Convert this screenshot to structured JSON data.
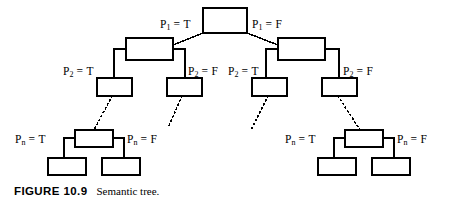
{
  "figure": {
    "number_label": "FIGURE 10.9",
    "caption": "Semantic tree."
  },
  "diagram": {
    "type": "binary-semantic-tree",
    "stroke_color": "#000000",
    "node_fill": "#ffffff",
    "edge_styles": [
      "solid",
      "dotted"
    ],
    "labels": {
      "p1_true": {
        "var": "P",
        "sub": "1",
        "eq": " = ",
        "val": "T"
      },
      "p1_false": {
        "var": "P",
        "sub": "1",
        "eq": " = ",
        "val": "F"
      },
      "p2_true_left": {
        "var": "P",
        "sub": "2",
        "eq": " = ",
        "val": "T"
      },
      "p2_false_left": {
        "var": "P",
        "sub": "2",
        "eq": " = ",
        "val": "F"
      },
      "p2_true_right": {
        "var": "P",
        "sub": "2",
        "eq": " = ",
        "val": "T"
      },
      "p2_false_right": {
        "var": "P",
        "sub": "2",
        "eq": " = ",
        "val": "F"
      },
      "pn_true_left": {
        "var": "P",
        "sub": "n",
        "eq": " = ",
        "val": "T"
      },
      "pn_false_left": {
        "var": "P",
        "sub": "n",
        "eq": " = ",
        "val": "F"
      },
      "pn_true_right": {
        "var": "P",
        "sub": "n",
        "eq": " = ",
        "val": "T"
      },
      "pn_false_right": {
        "var": "P",
        "sub": "n",
        "eq": " = ",
        "val": "F"
      }
    },
    "nodes": [
      {
        "id": "root",
        "level": 1,
        "x": 203,
        "y": 8,
        "w": 44,
        "h": 25
      },
      {
        "id": "l2-left",
        "level": 2,
        "x": 126,
        "y": 38,
        "w": 47,
        "h": 22
      },
      {
        "id": "l2-right",
        "level": 2,
        "x": 278,
        "y": 38,
        "w": 47,
        "h": 22
      },
      {
        "id": "l3-a",
        "level": 3,
        "x": 97,
        "y": 78,
        "w": 35,
        "h": 18
      },
      {
        "id": "l3-b",
        "level": 3,
        "x": 167,
        "y": 78,
        "w": 35,
        "h": 18
      },
      {
        "id": "l3-c",
        "level": 3,
        "x": 252,
        "y": 78,
        "w": 35,
        "h": 18
      },
      {
        "id": "l3-d",
        "level": 3,
        "x": 322,
        "y": 78,
        "w": 35,
        "h": 18
      },
      {
        "id": "ln-left-parent",
        "level": "n",
        "x": 75,
        "y": 130,
        "w": 38,
        "h": 17
      },
      {
        "id": "ln-left-leaf-t",
        "level": "n",
        "x": 48,
        "y": 158,
        "w": 38,
        "h": 17
      },
      {
        "id": "ln-left-leaf-f",
        "level": "n",
        "x": 102,
        "y": 158,
        "w": 38,
        "h": 17
      },
      {
        "id": "ln-right-parent",
        "level": "n",
        "x": 345,
        "y": 130,
        "w": 38,
        "h": 17
      },
      {
        "id": "ln-right-leaf-t",
        "level": "n",
        "x": 318,
        "y": 158,
        "w": 38,
        "h": 17
      },
      {
        "id": "ln-right-leaf-f",
        "level": "n",
        "x": 372,
        "y": 158,
        "w": 38,
        "h": 17
      }
    ]
  }
}
